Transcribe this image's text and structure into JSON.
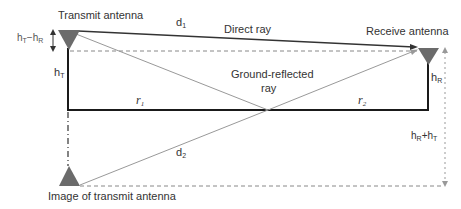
{
  "diagram": {
    "labels": {
      "transmit_antenna": "Transmit antenna",
      "receive_antenna": "Receive antenna",
      "image_antenna": "Image of transmit antenna",
      "direct_ray": "Direct ray",
      "ground_reflected_1": "Ground-reflected",
      "ground_reflected_2": "ray",
      "d1": "d",
      "d1_sub": "1",
      "d2": "d",
      "d2_sub": "2",
      "r1": "r",
      "r1_sub": "1",
      "r2": "r",
      "r2_sub": "2",
      "hT": "h",
      "hT_sub": "T",
      "hR": "h",
      "hR_sub": "R",
      "hT_minus_hR_h1": "h",
      "hT_minus_hR_s1": "T",
      "hT_minus_hR_op": "−h",
      "hT_minus_hR_s2": "R",
      "hR_plus_hT_h1": "h",
      "hR_plus_hT_s1": "R",
      "hR_plus_hT_op": "+h",
      "hR_plus_hT_s2": "T"
    },
    "colors": {
      "antenna_fill": "#6b6b6b",
      "ground_line": "#1a1a1a",
      "ray_line": "#999999",
      "dashed_line": "#888888"
    }
  }
}
